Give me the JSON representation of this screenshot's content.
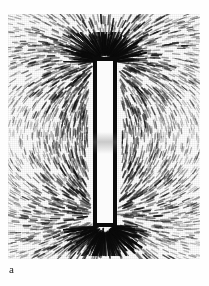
{
  "figure": {
    "panel_label": "a",
    "media": "black-and-white-photograph",
    "colors": {
      "page_background": "#ffffff",
      "plate_background": "#fdfdfd",
      "filings_ink": "#0b0b0b",
      "magnet_outline": "#0b0b0b",
      "magnet_fill": "#fbfbfb",
      "label_text": "#1a1a1a"
    },
    "plate": {
      "x": 8,
      "y": 14,
      "width": 192,
      "height": 245
    },
    "magnet": {
      "x": 85,
      "y": 43,
      "width": 24,
      "height": 170,
      "orientation": "vertical"
    }
  },
  "chart_data": {
    "type": "scatter",
    "xlabel": "",
    "ylabel": "",
    "annotations": [
      "a"
    ],
    "legend_entries": [],
    "grid": false,
    "xlim": [
      0,
      192
    ],
    "ylim": [
      0,
      245
    ],
    "dipole": {
      "north_pole": [
        97,
        45
      ],
      "south_pole": [
        97,
        200
      ],
      "strength": 1.0
    },
    "field_seeds": [
      {
        "ring": 1,
        "count": 34,
        "radius": 16,
        "density": "very-high"
      },
      {
        "ring": 2,
        "count": 40,
        "radius": 30,
        "density": "high"
      },
      {
        "ring": 3,
        "count": 44,
        "radius": 46,
        "density": "high"
      },
      {
        "ring": 4,
        "count": 46,
        "radius": 64,
        "density": "medium"
      },
      {
        "ring": 5,
        "count": 46,
        "radius": 84,
        "density": "medium"
      },
      {
        "ring": 6,
        "count": 42,
        "radius": 106,
        "density": "low"
      },
      {
        "ring": 7,
        "count": 38,
        "radius": 128,
        "density": "low"
      }
    ],
    "pole_burst_spokes": {
      "north": 46,
      "south": 46,
      "length_px": 30
    }
  }
}
